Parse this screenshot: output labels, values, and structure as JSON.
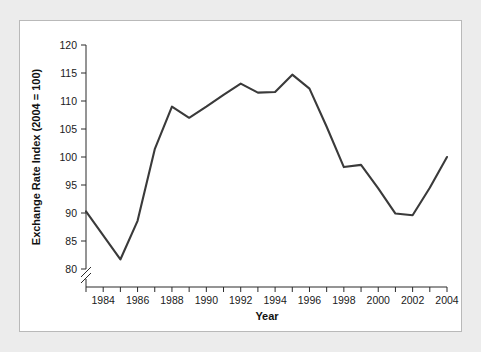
{
  "figure": {
    "background_color": "#ececec",
    "card_color": "#ffffff",
    "frame_color": "#b9b9b9"
  },
  "chart_data": {
    "type": "line",
    "title": "",
    "subtitle": "",
    "xlabel": "Year",
    "ylabel": "Exchange Rate Index (2004 = 100)",
    "xlim": [
      1983,
      2004
    ],
    "ylim": [
      80,
      120
    ],
    "y_axis_break": true,
    "y_axis_break_note": "axis broken below 80",
    "grid": false,
    "legend": false,
    "legend_position": "none",
    "line_color": "#3a3a3a",
    "x_ticks_all": [
      1983,
      1984,
      1985,
      1986,
      1987,
      1988,
      1989,
      1990,
      1991,
      1992,
      1993,
      1994,
      1995,
      1996,
      1997,
      1998,
      1999,
      2000,
      2001,
      2002,
      2003,
      2004
    ],
    "x_tick_labels": [
      "1984",
      "1986",
      "1988",
      "1990",
      "1992",
      "1994",
      "1996",
      "1998",
      "2000",
      "2002",
      "2004"
    ],
    "x_tick_label_values": [
      1984,
      1986,
      1988,
      1990,
      1992,
      1994,
      1996,
      1998,
      2000,
      2002,
      2004
    ],
    "y_ticks": [
      80,
      85,
      90,
      95,
      100,
      105,
      110,
      115,
      120
    ],
    "y_tick_labels": [
      "80",
      "85",
      "90",
      "95",
      "100",
      "105",
      "110",
      "115",
      "120"
    ],
    "x": [
      1983,
      1984,
      1985,
      1986,
      1987,
      1988,
      1989,
      1990,
      1991,
      1992,
      1993,
      1994,
      1995,
      1996,
      1997,
      1998,
      1999,
      2000,
      2001,
      2002,
      2003,
      2004
    ],
    "values": [
      90.3,
      86.0,
      81.7,
      88.6,
      101.4,
      109.0,
      107.0,
      109.0,
      111.1,
      113.1,
      111.5,
      111.6,
      114.7,
      112.2,
      105.4,
      98.2,
      98.6,
      94.4,
      89.9,
      89.6,
      94.5,
      100.0
    ],
    "series": [
      {
        "name": "Exchange Rate Index",
        "values": [
          90.3,
          86.0,
          81.7,
          88.6,
          101.4,
          109.0,
          107.0,
          109.0,
          111.1,
          113.1,
          111.5,
          111.6,
          114.7,
          112.2,
          105.4,
          98.2,
          98.6,
          94.4,
          89.9,
          89.6,
          94.5,
          100.0
        ]
      }
    ]
  }
}
